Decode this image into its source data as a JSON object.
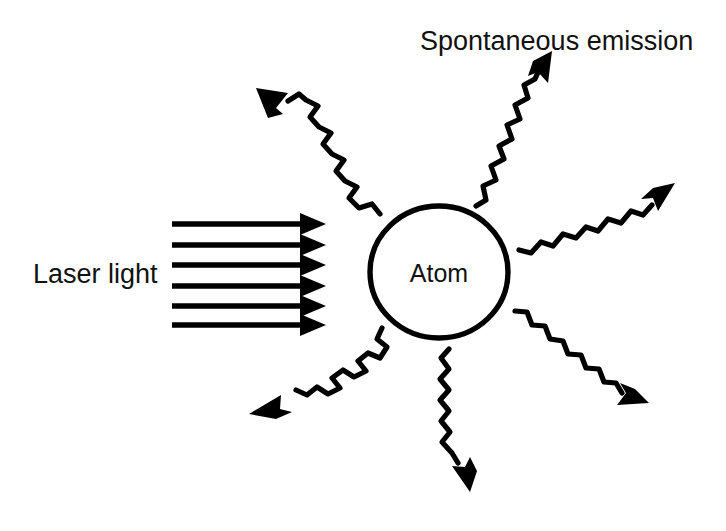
{
  "figure": {
    "background_color": "#ffffff",
    "ink_color": "#000000"
  },
  "labels": {
    "spontaneous_emission": "Spontaneous emission",
    "laser_light": "Laser light",
    "atom": "Atom"
  },
  "atom": {
    "shape": "circle",
    "center_x": 439,
    "center_y": 272,
    "radius_x": 69,
    "radius_y": 66,
    "label": "Atom"
  },
  "laser_beam": {
    "label": "Laser light",
    "direction": "rightward",
    "ray_count": 6,
    "x_start": 172,
    "x_tip": 326,
    "ray_y": [
      224,
      245,
      265,
      286,
      306,
      325
    ]
  },
  "emission_arrows": [
    {
      "name": "emission-up-left",
      "angle_deg": 136,
      "tail_x": 378,
      "tail_y": 212,
      "tip_x": 258,
      "tip_y": 92
    },
    {
      "name": "emission-up",
      "angle_deg": 65,
      "tail_x": 478,
      "tail_y": 205,
      "tip_x": 549,
      "tip_y": 58
    },
    {
      "name": "emission-right-up",
      "angle_deg": 22,
      "tail_x": 519,
      "tail_y": 248,
      "tip_x": 672,
      "tip_y": 184
    },
    {
      "name": "emission-right-down",
      "angle_deg": -35,
      "tail_x": 516,
      "tail_y": 312,
      "tip_x": 648,
      "tip_y": 400
    },
    {
      "name": "emission-down",
      "angle_deg": -80,
      "tail_x": 448,
      "tail_y": 348,
      "tip_x": 472,
      "tip_y": 492
    },
    {
      "name": "emission-down-left",
      "angle_deg": -145,
      "tail_x": 382,
      "tail_y": 326,
      "tip_x": 250,
      "tip_y": 415
    }
  ],
  "text_positions": {
    "spontaneous_emission": {
      "x": 420,
      "y": 50
    },
    "laser_light": {
      "x": 33,
      "y": 283
    },
    "atom": {
      "x": 439,
      "y": 282
    }
  }
}
